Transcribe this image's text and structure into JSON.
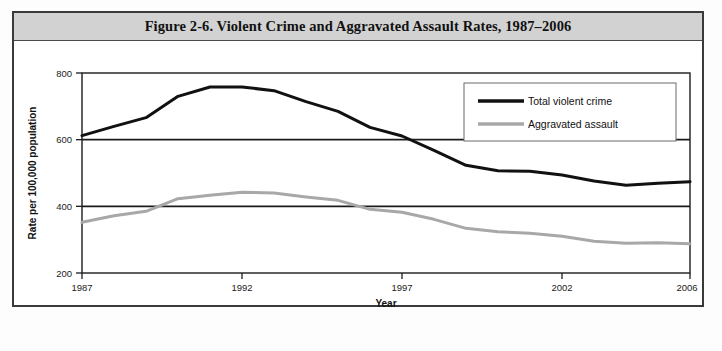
{
  "figure": {
    "title": "Figure 2-6. Violent Crime and Aggravated Assault Rates, 1987–2006",
    "title_band_color": "#d2d2d2",
    "border_color": "#3a3a3a",
    "background_color": "#ffffff"
  },
  "chart_data": {
    "type": "line",
    "title": "Figure 2-6. Violent Crime and Aggravated Assault Rates, 1987–2006",
    "xlabel": "Year",
    "ylabel": "Rate per 100,000 population",
    "xlim": [
      1987,
      2006
    ],
    "ylim": [
      200,
      800
    ],
    "xticks": [
      1987,
      1992,
      1997,
      2002,
      2006
    ],
    "xtick_labels": [
      "1987",
      "1992",
      "1997",
      "2002",
      "2006"
    ],
    "yticks": [
      200,
      400,
      600,
      800
    ],
    "ytick_labels": [
      "200",
      "400",
      "600",
      "800"
    ],
    "grid": "horizontal gridlines at 400 and 600",
    "legend_position": "upper right inside plot",
    "x": [
      1987,
      1988,
      1989,
      1990,
      1991,
      1992,
      1993,
      1994,
      1995,
      1996,
      1997,
      1998,
      1999,
      2000,
      2001,
      2002,
      2003,
      2004,
      2005,
      2006
    ],
    "series": [
      {
        "name": "Total violent crime",
        "color": "#111111",
        "line_width": 3,
        "values": [
          612,
          640,
          666,
          730,
          758,
          758,
          747,
          714,
          685,
          637,
          611,
          568,
          523,
          507,
          505,
          494,
          476,
          463,
          469,
          474
        ]
      },
      {
        "name": "Aggravated assault",
        "color": "#a8a8a8",
        "line_width": 3,
        "values": [
          352,
          372,
          385,
          423,
          433,
          442,
          440,
          428,
          418,
          391,
          382,
          361,
          334,
          324,
          319,
          310,
          295,
          289,
          291,
          288
        ]
      }
    ]
  },
  "legend": {
    "items": [
      {
        "label": "Total violent crime",
        "color": "#111111"
      },
      {
        "label": "Aggravated assault",
        "color": "#a8a8a8"
      }
    ]
  }
}
